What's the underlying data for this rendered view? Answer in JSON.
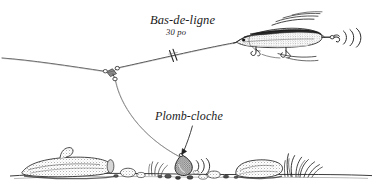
{
  "figure": {
    "background_color": "#ffffff",
    "ink_color": "#1a1a1a",
    "width": 379,
    "height": 190
  },
  "labels": {
    "leader": {
      "text": "Bas-de-ligne",
      "measure": "30 po",
      "icon": "leader-break-marks-icon"
    },
    "sinker": {
      "text": "Plomb-cloche",
      "icon": "arrow-down-icon"
    }
  },
  "components": {
    "main_line": "main-line",
    "swivel": "three-way-swivel",
    "leader_line": "leader-line",
    "dropper_line": "dropper-line",
    "lure": "minnow-lure",
    "lure_hooks": "treble-hooks",
    "motion_lines": "lure-motion-lines",
    "vibration_arcs": "lure-vibration-arcs",
    "sinker_body": "bell-sinker",
    "sinker_vibration": "sinker-vibration-arcs",
    "bottom_line": "lake-bottom",
    "log": "submerged-log",
    "rock": "bottom-rock",
    "weeds": "bottom-weeds",
    "pebbles": "bottom-pebbles"
  }
}
